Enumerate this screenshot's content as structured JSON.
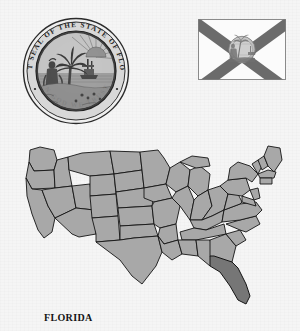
{
  "page": {
    "subject": "Florida",
    "caption": "FLORIDA",
    "background_color": "#f5f5f5"
  },
  "seal": {
    "name": "Great Seal of the State of Florida",
    "rim_text_top": "GREAT SEAL OF THE STATE OF FLORIDA",
    "motto": "IN GOD WE TRUST",
    "ring_color": "#2b2b2b",
    "field_color": "#b9b9b9",
    "ink_color": "#3a3a3a",
    "elements": [
      "sabal palm",
      "steamboat",
      "sun rays",
      "seminole woman",
      "flowers",
      "water"
    ]
  },
  "flag": {
    "name": "Flag of Florida",
    "field_color": "#fbfbfb",
    "saltire_color": "#6b6b6b",
    "border_color": "#8a8a8a",
    "center_emblem": "state-seal"
  },
  "map": {
    "title": "United States",
    "state_fill": "#a8a8a8",
    "highlight_fill": "#767676",
    "border_color": "#1a1a1a",
    "highlighted_state": "Florida"
  }
}
